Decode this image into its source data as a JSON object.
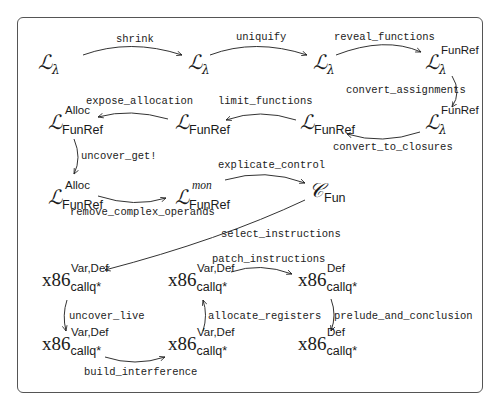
{
  "diagram": {
    "type": "compiler-pass-flowchart",
    "nodes": [
      {
        "id": "n1",
        "base": "L",
        "sub": "λ",
        "sup": ""
      },
      {
        "id": "n2",
        "base": "L",
        "sub": "λ",
        "sup": ""
      },
      {
        "id": "n3",
        "base": "L",
        "sub": "λ",
        "sup": ""
      },
      {
        "id": "n4",
        "base": "L",
        "sub": "λ",
        "sup": "FunRef"
      },
      {
        "id": "n5",
        "base": "L",
        "sub": "λ",
        "sup": "FunRef"
      },
      {
        "id": "n6",
        "base": "L",
        "sub": "FunRef",
        "sup": ""
      },
      {
        "id": "n7",
        "base": "L",
        "sub": "FunRef",
        "sup": "Alloc"
      },
      {
        "id": "n8",
        "base": "L",
        "sub": "FunRef",
        "sup": "Alloc"
      },
      {
        "id": "n9",
        "base": "L",
        "sub": "FunRef",
        "sup": "mon"
      },
      {
        "id": "n10",
        "base": "C",
        "sub": "Fun",
        "sup": ""
      },
      {
        "id": "n11",
        "base": "x86",
        "sub": "callq*",
        "sup": "Var,Def"
      },
      {
        "id": "n12",
        "base": "x86",
        "sub": "callq*",
        "sup": "Var,Def"
      },
      {
        "id": "n13",
        "base": "x86",
        "sub": "callq*",
        "sup": "Var,Def"
      },
      {
        "id": "n14",
        "base": "x86",
        "sub": "callq*",
        "sup": "Var,Def"
      },
      {
        "id": "n15",
        "base": "x86",
        "sub": "callq*",
        "sup": "Def"
      },
      {
        "id": "n16",
        "base": "x86",
        "sub": "callq*",
        "sup": "Def"
      }
    ],
    "edges": [
      {
        "from": "n1",
        "to": "n2",
        "label": "shrink"
      },
      {
        "from": "n2",
        "to": "n3",
        "label": "uniquify"
      },
      {
        "from": "n3",
        "to": "n4",
        "label": "reveal_functions"
      },
      {
        "from": "n4",
        "to": "n5",
        "label": "convert_assignments"
      },
      {
        "from": "n5",
        "to": "n6",
        "label": "convert_to_closures"
      },
      {
        "from": "n6",
        "to": "n7",
        "label": "limit_functions"
      },
      {
        "from": "n7",
        "to": "n8",
        "label": "expose_allocation"
      },
      {
        "from": "n7",
        "to": "n8",
        "label": "uncover_get!"
      },
      {
        "from": "n8",
        "to": "n9",
        "label": "remove_complex_operands"
      },
      {
        "from": "n9",
        "to": "n10",
        "label": "explicate_control"
      },
      {
        "from": "n10",
        "to": "n11",
        "label": "select_instructions"
      },
      {
        "from": "n11",
        "to": "n12",
        "label": "uncover_live"
      },
      {
        "from": "n12",
        "to": "n13",
        "label": "build_interference"
      },
      {
        "from": "n13",
        "to": "n14",
        "label": "allocate_registers"
      },
      {
        "from": "n14",
        "to": "n15",
        "label": "patch_instructions"
      },
      {
        "from": "n15",
        "to": "n16",
        "label": "prelude_and_conclusion"
      }
    ]
  },
  "glyphs": {
    "L": "ℒ",
    "C": "𝒞",
    "x86": "x86"
  }
}
